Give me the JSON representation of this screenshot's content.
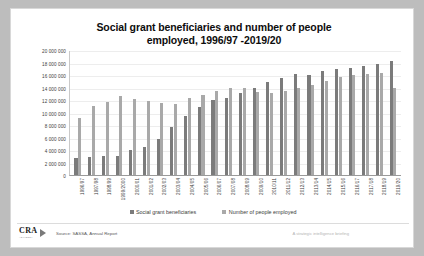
{
  "chart_data": {
    "type": "bar",
    "title": "Social grant beneficiaries and number of people employed, 1996/97 -2019/20",
    "title_line1": "Social grant beneficiaries and number of people",
    "title_line2": "employed, 1996/97 -2019/20",
    "xlabel": "",
    "ylabel": "",
    "ylim": [
      0,
      20000000
    ],
    "grid": true,
    "legend_position": "bottom",
    "ytick_labels": [
      "20 000 000",
      "18 000 000",
      "16 000 000",
      "14 000 000",
      "12 000 000",
      "10 000 000",
      "8 000 000",
      "6 000 000",
      "4 000 000",
      "2 000 000",
      "0"
    ],
    "ytick_values": [
      20000000,
      18000000,
      16000000,
      14000000,
      12000000,
      10000000,
      8000000,
      6000000,
      4000000,
      2000000,
      0
    ],
    "categories": [
      "1996/97",
      "1997/98",
      "1998/99",
      "1999/2000",
      "2000/01",
      "2001/02",
      "2002/03",
      "2003/04",
      "2004/05",
      "2005/06",
      "2006/07",
      "2007/08",
      "2008/09",
      "2009/10",
      "2010/11",
      "2011/12",
      "2012/13",
      "2013/14",
      "2014/15",
      "2015/16",
      "2016/17",
      "2017/18",
      "2018/19",
      "2019/20"
    ],
    "series": [
      {
        "name": "Social grant beneficiaries",
        "color": "#7b7b7b",
        "values": [
          2800000,
          2900000,
          3000000,
          3100000,
          4000000,
          4500000,
          5800000,
          7700000,
          9400000,
          10900000,
          12000000,
          12400000,
          13100000,
          13900000,
          14900000,
          15600000,
          16100000,
          16000000,
          16600000,
          17000000,
          17200000,
          17500000,
          17800000,
          18300000
        ]
      },
      {
        "name": "Number of people employed",
        "color": "#a9a9a9",
        "values": [
          9200000,
          11000000,
          11700000,
          12600000,
          12100000,
          11900000,
          11600000,
          11400000,
          12300000,
          12800000,
          13400000,
          13900000,
          14000000,
          13300000,
          13100000,
          13500000,
          14000000,
          14400000,
          15100000,
          15700000,
          16000000,
          16200000,
          16400000,
          14000000
        ]
      }
    ]
  },
  "footer": {
    "logo_text": "CRA",
    "logo_sub": "ADVISORY",
    "source": "Source: SASSA, Annual Report",
    "tagline": "A strategic intelligence briefing"
  }
}
